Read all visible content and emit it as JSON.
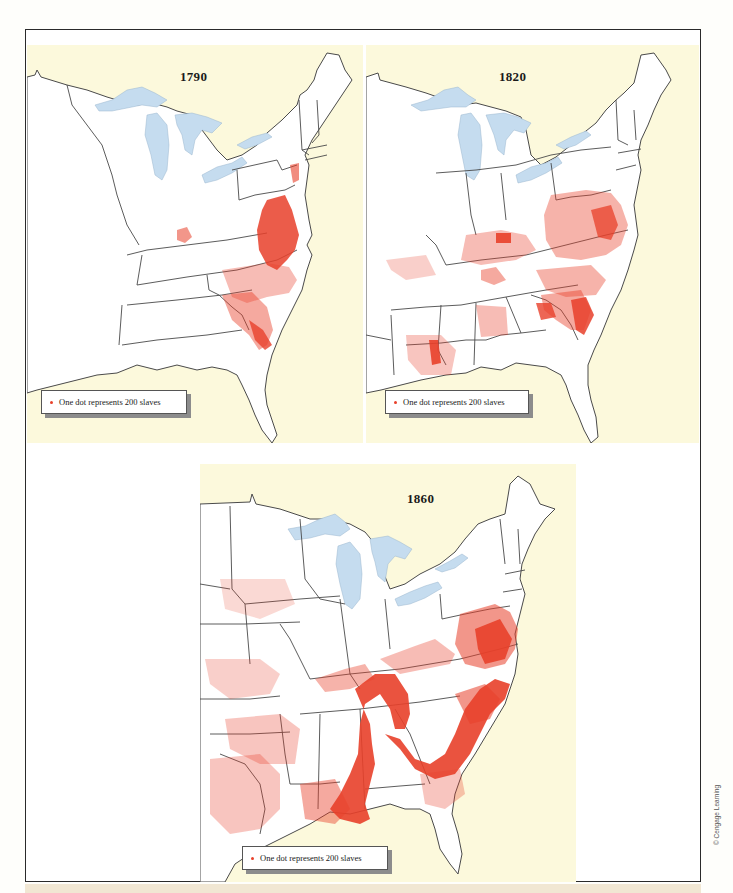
{
  "figure": {
    "credit": "© Cengage Learning",
    "colors": {
      "sea": "#fcf9dc",
      "land": "#ffffff",
      "lakes": "#c5dcef",
      "borders": "#4a4a4a",
      "dots": "#e8402a",
      "frame": "#2a2a2a"
    }
  },
  "maps": [
    {
      "year": "1790",
      "legend": "One dot represents 200 slaves",
      "concentrations": [
        "Chesapeake (Virginia & Maryland)",
        "Coastal North & South Carolina",
        "Kentucky (Bluegrass)",
        "New York/New Jersey (sparse)"
      ]
    },
    {
      "year": "1820",
      "legend": "One dot represents 200 slaves",
      "concentrations": [
        "Virginia & Maryland",
        "Carolinas & Georgia coast",
        "Kentucky & Tennessee",
        "Lower Mississippi (Louisiana)",
        "Alabama (scattered)",
        "Missouri (sparse)"
      ]
    },
    {
      "year": "1860",
      "legend": "One dot represents 200 slaves",
      "concentrations": [
        "Virginia & North Carolina",
        "South Carolina & Georgia",
        "Alabama Black Belt",
        "Mississippi River valley",
        "Tennessee & Kentucky",
        "Missouri River valley",
        "East Texas",
        "Louisiana",
        "Arkansas"
      ]
    }
  ]
}
